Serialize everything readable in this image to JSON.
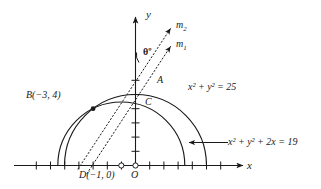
{
  "figure": {
    "type": "geometry-diagram",
    "background_color": "#ffffff",
    "stroke_color": "#1a1a1a",
    "dotted_color": "#555555"
  },
  "axes": {
    "x_label": "x",
    "y_label": "y",
    "origin_label": "O",
    "x_min": -7,
    "x_max": 7,
    "y_min": 0,
    "y_max": 6,
    "tick_step": 1,
    "grid": false
  },
  "points": [
    {
      "name": "B",
      "label": "B(−3, 4)",
      "x": -3,
      "y": 4,
      "marker": "filled"
    },
    {
      "name": "D",
      "label": "D(−1, 0)",
      "x": -1,
      "y": 0,
      "marker": "open"
    },
    {
      "name": "O",
      "label": "O",
      "x": 0,
      "y": 0,
      "marker": "open"
    },
    {
      "name": "A",
      "label": "A",
      "x": 1.2,
      "y": 4.85,
      "marker": "none"
    },
    {
      "name": "C",
      "label": "C",
      "x": 0.45,
      "y": 3.55,
      "marker": "none"
    }
  ],
  "curves": [
    {
      "name": "outer-semicircle",
      "equation_label": "x² + y² = 25",
      "center_x": 0,
      "center_y": 0,
      "radius": 5
    },
    {
      "name": "inner-semicircle",
      "equation_label": "x² + y² + 2x = 19",
      "center_x": -1,
      "center_y": 0,
      "radius": 4.472
    }
  ],
  "rays": [
    {
      "name": "m2",
      "label": "m",
      "subscript": "2",
      "from": "B",
      "through": "D"
    },
    {
      "name": "m1",
      "label": "m",
      "subscript": "1",
      "from": "B",
      "through": "O"
    }
  ],
  "angle": {
    "name": "theta",
    "label": "θº",
    "between": [
      "m1",
      "m2"
    ]
  },
  "annotations": {
    "outer_equation": "x² + y² = 25",
    "inner_equation": "x² + y² + 2x = 19",
    "inner_equation_has_leader_arrow": true
  }
}
